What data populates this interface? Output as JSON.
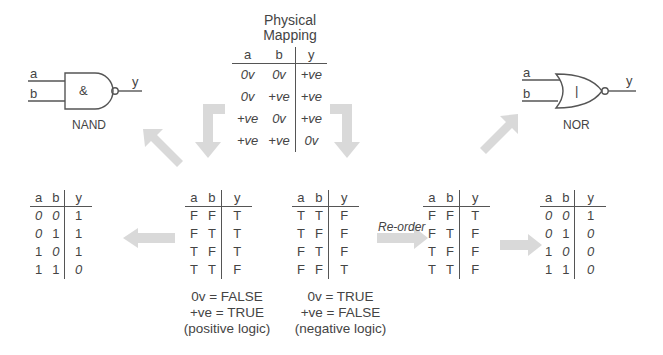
{
  "physical_mapping": {
    "title_line1": "Physical",
    "title_line2": "Mapping",
    "headers": [
      "a",
      "b",
      "y"
    ],
    "rows": [
      [
        "0v",
        "0v",
        "+ve"
      ],
      [
        "0v",
        "+ve",
        "+ve"
      ],
      [
        "+ve",
        "0v",
        "+ve"
      ],
      [
        "+ve",
        "+ve",
        "0v"
      ]
    ]
  },
  "nand": {
    "input_a": "a",
    "input_b": "b",
    "output": "y",
    "symbol": "&",
    "label": "NAND"
  },
  "nor": {
    "input_a": "a",
    "input_b": "b",
    "output": "y",
    "symbol": "|",
    "label": "NOR"
  },
  "nand_binary_table": {
    "headers": [
      "a",
      "b",
      "y"
    ],
    "rows": [
      [
        "0",
        "0",
        "1"
      ],
      [
        "0",
        "1",
        "1"
      ],
      [
        "1",
        "0",
        "1"
      ],
      [
        "1",
        "1",
        "0"
      ]
    ]
  },
  "positive_logic_table": {
    "headers": [
      "a",
      "b",
      "y"
    ],
    "rows": [
      [
        "F",
        "F",
        "T"
      ],
      [
        "F",
        "T",
        "T"
      ],
      [
        "T",
        "F",
        "T"
      ],
      [
        "T",
        "T",
        "F"
      ]
    ],
    "caption_line1": "0v = FALSE",
    "caption_line2": "+ve = TRUE",
    "caption_line3": "(positive logic)"
  },
  "negative_logic_table": {
    "headers": [
      "a",
      "b",
      "y"
    ],
    "rows": [
      [
        "T",
        "T",
        "F"
      ],
      [
        "T",
        "F",
        "F"
      ],
      [
        "F",
        "T",
        "F"
      ],
      [
        "F",
        "F",
        "T"
      ]
    ],
    "caption_line1": "0v = TRUE",
    "caption_line2": "+ve = FALSE",
    "caption_line3": "(negative logic)"
  },
  "reorder_label": "Re-order",
  "reordered_table": {
    "headers": [
      "a",
      "b",
      "y"
    ],
    "rows": [
      [
        "F",
        "F",
        "T"
      ],
      [
        "F",
        "T",
        "F"
      ],
      [
        "T",
        "F",
        "F"
      ],
      [
        "T",
        "T",
        "F"
      ]
    ]
  },
  "nor_binary_table": {
    "headers": [
      "a",
      "b",
      "y"
    ],
    "rows": [
      [
        "0",
        "0",
        "1"
      ],
      [
        "0",
        "1",
        "0"
      ],
      [
        "1",
        "0",
        "0"
      ],
      [
        "1",
        "1",
        "0"
      ]
    ]
  },
  "colors": {
    "arrow": "#d9d9d9",
    "line": "#555555",
    "text": "#444444"
  }
}
